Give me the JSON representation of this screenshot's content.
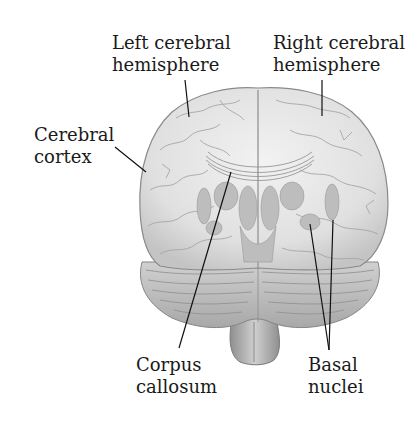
{
  "figure": {
    "labels": {
      "left_hemisphere": {
        "line1": "Left cerebral",
        "line2": "hemisphere"
      },
      "right_hemisphere": {
        "line1": "Right cerebral",
        "line2": "hemisphere"
      },
      "cerebral_cortex": {
        "line1": "Cerebral",
        "line2": "cortex"
      },
      "corpus_callosum": {
        "line1": "Corpus",
        "line2": "callosum"
      },
      "basal_nuclei": {
        "line1": "Basal",
        "line2": "nuclei"
      }
    },
    "colors": {
      "background": "#ffffff",
      "text": "#1a1a1a",
      "leader_line": "#111111",
      "brain_fill": "#e4e4e4",
      "brain_shade": "#b8b8b8",
      "brain_outline": "#8a8a8a"
    }
  }
}
